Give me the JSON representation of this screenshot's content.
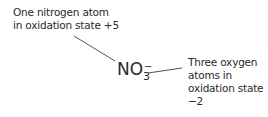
{
  "nitrogen_label": {
    "line1": "One nitrogen atom",
    "line2": "in oxidation state +5"
  },
  "formula": {
    "base": "NO",
    "subscript": "3",
    "charge": "−"
  },
  "oxygen_label": {
    "line1": "Three oxygen",
    "line2": "atoms in",
    "line3": "oxidation state",
    "line4": "−2"
  },
  "colors": {
    "text": "#2a2a2a",
    "leader_line": "#555555"
  }
}
